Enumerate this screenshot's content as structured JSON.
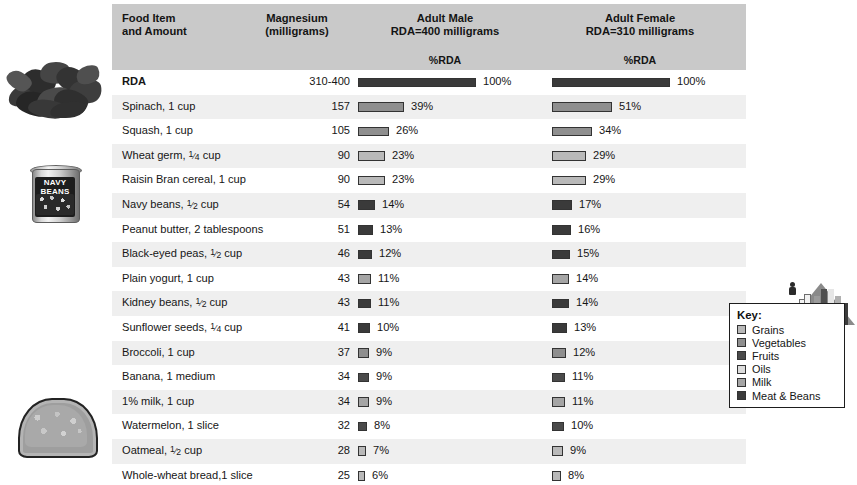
{
  "header": {
    "col_food": "Food Item\nand Amount",
    "col_food_line1": "Food Item",
    "col_food_line2": "and Amount",
    "col_mag_line1": "Magnesium",
    "col_mag_line2": "(milligrams)",
    "col_male_line1": "Adult Male",
    "col_male_line2": "RDA=400 milligrams",
    "col_female_line1": "Adult Female",
    "col_female_line2": "RDA=310 milligrams",
    "sub_male": "%RDA",
    "sub_female": "%RDA"
  },
  "key": {
    "title": "Key:",
    "items": [
      {
        "label": "Grains",
        "color": "#b9b9b9"
      },
      {
        "label": "Vegetables",
        "color": "#8f8f8f"
      },
      {
        "label": "Fruits",
        "color": "#4a4a4a"
      },
      {
        "label": "Oils",
        "color": "#dcdcdc"
      },
      {
        "label": "Milk",
        "color": "#a5a5a5"
      },
      {
        "label": "Meat & Beans",
        "color": "#3a3a3a"
      }
    ]
  },
  "illustrations": [
    {
      "name": "spinach-photo",
      "label": "spinach"
    },
    {
      "name": "navy-beans-can-photo",
      "label_line1": "NAVY",
      "label_line2": "BEANS"
    },
    {
      "name": "bread-slice-photo",
      "label": "whole-wheat bread slice"
    }
  ],
  "chart_data": {
    "type": "bar",
    "columns": [
      "Food Item and Amount",
      "Magnesium (milligrams)",
      "Adult Male RDA=400 milligrams %RDA",
      "Adult Female RDA=310 milligrams %RDA"
    ],
    "male_rda_mg": 400,
    "female_rda_mg": 310,
    "xlabel": "%RDA",
    "ylabel": "Food Item and Amount",
    "xlim": [
      0,
      100
    ],
    "grid": false,
    "legend_position": "bottom-right",
    "rows": [
      {
        "food": "RDA",
        "food_pre": "RDA",
        "food_frac": "",
        "food_post": "",
        "mg": "310-400",
        "male_pct": 100,
        "male_label": "100%",
        "female_pct": 100,
        "female_label": "100%",
        "group": "rda",
        "color": "#3a3a3a",
        "bold": true
      },
      {
        "food": "Spinach, 1 cup",
        "food_pre": "Spinach, 1 cup",
        "food_frac": "",
        "food_post": "",
        "mg": "157",
        "male_pct": 39,
        "male_label": "39%",
        "female_pct": 51,
        "female_label": "51%",
        "group": "Vegetables",
        "color": "#8f8f8f",
        "bold": false
      },
      {
        "food": "Squash, 1 cup",
        "food_pre": "Squash, 1 cup",
        "food_frac": "",
        "food_post": "",
        "mg": "105",
        "male_pct": 26,
        "male_label": "26%",
        "female_pct": 34,
        "female_label": "34%",
        "group": "Vegetables",
        "color": "#8f8f8f",
        "bold": false
      },
      {
        "food": "Wheat germ, 1/4 cup",
        "food_pre": "Wheat germ, ",
        "food_frac": "1/4",
        "food_post": " cup",
        "mg": "90",
        "male_pct": 23,
        "male_label": "23%",
        "female_pct": 29,
        "female_label": "29%",
        "group": "Grains",
        "color": "#b9b9b9",
        "bold": false
      },
      {
        "food": "Raisin Bran cereal, 1 cup",
        "food_pre": "Raisin Bran cereal, 1 cup",
        "food_frac": "",
        "food_post": "",
        "mg": "90",
        "male_pct": 23,
        "male_label": "23%",
        "female_pct": 29,
        "female_label": "29%",
        "group": "Grains",
        "color": "#b9b9b9",
        "bold": false
      },
      {
        "food": "Navy beans, 1/2 cup",
        "food_pre": "Navy beans, ",
        "food_frac": "1/2",
        "food_post": " cup",
        "mg": "54",
        "male_pct": 14,
        "male_label": "14%",
        "female_pct": 17,
        "female_label": "17%",
        "group": "Meat & Beans",
        "color": "#3a3a3a",
        "bold": false
      },
      {
        "food": "Peanut butter, 2 tablespoons",
        "food_pre": "Peanut butter, 2 tablespoons",
        "food_frac": "",
        "food_post": "",
        "mg": "51",
        "male_pct": 13,
        "male_label": "13%",
        "female_pct": 16,
        "female_label": "16%",
        "group": "Meat & Beans",
        "color": "#3a3a3a",
        "bold": false
      },
      {
        "food": "Black-eyed peas, 1/2 cup",
        "food_pre": "Black-eyed peas, ",
        "food_frac": "1/2",
        "food_post": " cup",
        "mg": "46",
        "male_pct": 12,
        "male_label": "12%",
        "female_pct": 15,
        "female_label": "15%",
        "group": "Meat & Beans",
        "color": "#3a3a3a",
        "bold": false
      },
      {
        "food": "Plain yogurt, 1 cup",
        "food_pre": "Plain yogurt, 1 cup",
        "food_frac": "",
        "food_post": "",
        "mg": "43",
        "male_pct": 11,
        "male_label": "11%",
        "female_pct": 14,
        "female_label": "14%",
        "group": "Milk",
        "color": "#a5a5a5",
        "bold": false
      },
      {
        "food": "Kidney beans, 1/2 cup",
        "food_pre": "Kidney beans, ",
        "food_frac": "1/2",
        "food_post": " cup",
        "mg": "43",
        "male_pct": 11,
        "male_label": "11%",
        "female_pct": 14,
        "female_label": "14%",
        "group": "Meat & Beans",
        "color": "#3a3a3a",
        "bold": false
      },
      {
        "food": "Sunflower seeds, 1/4 cup",
        "food_pre": "Sunflower seeds, ",
        "food_frac": "1/4",
        "food_post": " cup",
        "mg": "41",
        "male_pct": 10,
        "male_label": "10%",
        "female_pct": 13,
        "female_label": "13%",
        "group": "Meat & Beans",
        "color": "#3a3a3a",
        "bold": false
      },
      {
        "food": "Broccoli, 1 cup",
        "food_pre": "Broccoli, 1 cup",
        "food_frac": "",
        "food_post": "",
        "mg": "37",
        "male_pct": 9,
        "male_label": "9%",
        "female_pct": 12,
        "female_label": "12%",
        "group": "Vegetables",
        "color": "#8f8f8f",
        "bold": false
      },
      {
        "food": "Banana, 1 medium",
        "food_pre": "Banana, 1 medium",
        "food_frac": "",
        "food_post": "",
        "mg": "34",
        "male_pct": 9,
        "male_label": "9%",
        "female_pct": 11,
        "female_label": "11%",
        "group": "Fruits",
        "color": "#4a4a4a",
        "bold": false
      },
      {
        "food": "1% milk, 1 cup",
        "food_pre": "1% milk, 1 cup",
        "food_frac": "",
        "food_post": "",
        "mg": "34",
        "male_pct": 9,
        "male_label": "9%",
        "female_pct": 11,
        "female_label": "11%",
        "group": "Milk",
        "color": "#a5a5a5",
        "bold": false
      },
      {
        "food": "Watermelon, 1 slice",
        "food_pre": "Watermelon, 1 slice",
        "food_frac": "",
        "food_post": "",
        "mg": "32",
        "male_pct": 8,
        "male_label": "8%",
        "female_pct": 10,
        "female_label": "10%",
        "group": "Fruits",
        "color": "#4a4a4a",
        "bold": false
      },
      {
        "food": "Oatmeal, 1/2 cup",
        "food_pre": "Oatmeal, ",
        "food_frac": "1/2",
        "food_post": " cup",
        "mg": "28",
        "male_pct": 7,
        "male_label": "7%",
        "female_pct": 9,
        "female_label": "9%",
        "group": "Grains",
        "color": "#b9b9b9",
        "bold": false
      },
      {
        "food": "Whole-wheat bread,1 slice",
        "food_pre": "Whole-wheat bread,1 slice",
        "food_frac": "",
        "food_post": "",
        "mg": "25",
        "male_pct": 6,
        "male_label": "6%",
        "female_pct": 8,
        "female_label": "8%",
        "group": "Grains",
        "color": "#b9b9b9",
        "bold": false
      }
    ]
  }
}
